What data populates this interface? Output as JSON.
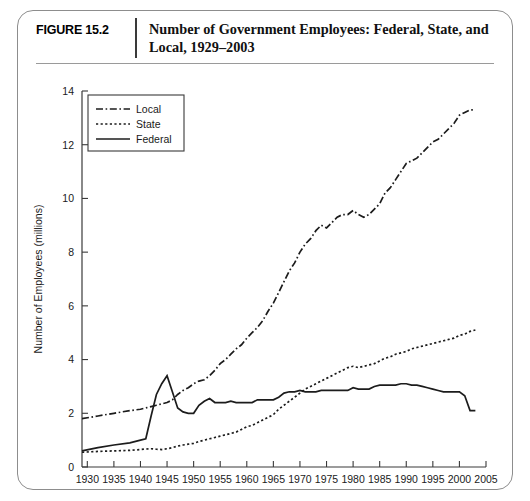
{
  "figure": {
    "number_label": "FIGURE 15.2",
    "title": "Number of Government Employees: Federal, State, and Local, 1929–2003"
  },
  "chart_data": {
    "type": "line",
    "title": "Number of Government Employees: Federal, State, and Local, 1929–2003",
    "xlabel": "",
    "ylabel": "Number of Employees (millions)",
    "xlim": [
      1929,
      2005
    ],
    "ylim": [
      0,
      14
    ],
    "xticks": [
      1930,
      1935,
      1940,
      1945,
      1950,
      1955,
      1960,
      1965,
      1970,
      1975,
      1980,
      1985,
      1990,
      1995,
      2000,
      2005
    ],
    "yticks": [
      0,
      2,
      4,
      6,
      8,
      10,
      12,
      14
    ],
    "grid": false,
    "legend_position": "top-left",
    "legend_entries": [
      "Local",
      "State",
      "Federal"
    ],
    "x": [
      1929,
      1932,
      1935,
      1938,
      1940,
      1941,
      1942,
      1943,
      1944,
      1945,
      1946,
      1947,
      1948,
      1949,
      1950,
      1951,
      1952,
      1953,
      1954,
      1955,
      1956,
      1957,
      1958,
      1959,
      1960,
      1961,
      1962,
      1963,
      1964,
      1965,
      1966,
      1967,
      1968,
      1969,
      1970,
      1971,
      1972,
      1973,
      1974,
      1975,
      1976,
      1977,
      1978,
      1979,
      1980,
      1981,
      1982,
      1983,
      1984,
      1985,
      1986,
      1987,
      1988,
      1989,
      1990,
      1991,
      1992,
      1993,
      1994,
      1995,
      1996,
      1997,
      1998,
      1999,
      2000,
      2001,
      2002,
      2003
    ],
    "series": [
      {
        "name": "Local",
        "style": "dash-dot",
        "values": [
          1.8,
          1.9,
          2.0,
          2.1,
          2.15,
          2.2,
          2.25,
          2.3,
          2.35,
          2.4,
          2.5,
          2.7,
          2.85,
          2.95,
          3.1,
          3.2,
          3.25,
          3.4,
          3.6,
          3.85,
          4.0,
          4.2,
          4.4,
          4.55,
          4.8,
          5.0,
          5.2,
          5.45,
          5.8,
          6.1,
          6.5,
          6.9,
          7.3,
          7.6,
          8.0,
          8.3,
          8.5,
          8.8,
          9.0,
          8.9,
          9.1,
          9.3,
          9.4,
          9.4,
          9.55,
          9.4,
          9.3,
          9.4,
          9.6,
          9.8,
          10.2,
          10.4,
          10.7,
          11.0,
          11.3,
          11.4,
          11.5,
          11.7,
          11.9,
          12.1,
          12.2,
          12.4,
          12.6,
          12.8,
          13.1,
          13.2,
          13.3,
          13.3
        ]
      },
      {
        "name": "State",
        "style": "dotted",
        "values": [
          0.55,
          0.58,
          0.6,
          0.62,
          0.65,
          0.67,
          0.68,
          0.66,
          0.65,
          0.68,
          0.72,
          0.78,
          0.82,
          0.85,
          0.88,
          0.95,
          1.0,
          1.05,
          1.1,
          1.15,
          1.2,
          1.25,
          1.3,
          1.4,
          1.5,
          1.55,
          1.65,
          1.75,
          1.85,
          1.95,
          2.15,
          2.3,
          2.45,
          2.6,
          2.75,
          2.9,
          3.0,
          3.1,
          3.2,
          3.3,
          3.4,
          3.5,
          3.6,
          3.7,
          3.75,
          3.7,
          3.75,
          3.8,
          3.85,
          3.95,
          4.05,
          4.1,
          4.2,
          4.25,
          4.3,
          4.4,
          4.45,
          4.5,
          4.55,
          4.6,
          4.65,
          4.7,
          4.75,
          4.8,
          4.9,
          4.95,
          5.05,
          5.1
        ]
      },
      {
        "name": "Federal",
        "style": "solid",
        "values": [
          0.6,
          0.72,
          0.82,
          0.9,
          1.0,
          1.05,
          1.9,
          2.7,
          3.1,
          3.4,
          2.8,
          2.2,
          2.05,
          2.0,
          2.0,
          2.3,
          2.45,
          2.55,
          2.4,
          2.4,
          2.4,
          2.45,
          2.4,
          2.4,
          2.4,
          2.4,
          2.5,
          2.5,
          2.5,
          2.5,
          2.6,
          2.75,
          2.8,
          2.8,
          2.85,
          2.8,
          2.8,
          2.8,
          2.85,
          2.85,
          2.85,
          2.85,
          2.85,
          2.85,
          2.95,
          2.9,
          2.9,
          2.9,
          3.0,
          3.05,
          3.05,
          3.05,
          3.05,
          3.1,
          3.1,
          3.05,
          3.05,
          3.0,
          2.95,
          2.9,
          2.85,
          2.8,
          2.8,
          2.8,
          2.8,
          2.65,
          2.1,
          2.1
        ]
      }
    ]
  }
}
